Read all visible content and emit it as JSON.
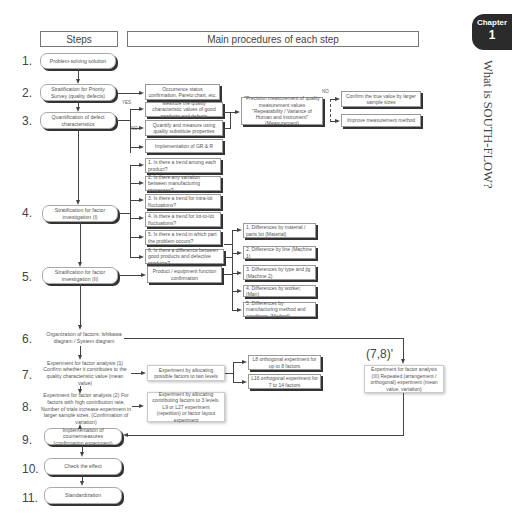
{
  "header": {
    "steps_label": "Steps",
    "main_label": "Main procedures of each step"
  },
  "chapter": {
    "label": "Chapter",
    "number": "1",
    "title": "What is SOUTH-FLOW?"
  },
  "steps": [
    {
      "num": "1.",
      "text": "Problem-solving solution"
    },
    {
      "num": "2.",
      "text": "Stratification for Priority Survey (quality defects)"
    },
    {
      "num": "3.",
      "text": "Quantification of defect characteristics"
    },
    {
      "num": "4.",
      "text": "Stratification for factor investigation (I)"
    },
    {
      "num": "5.",
      "text": "Stratification for factor investigation (II)"
    },
    {
      "num": "6.",
      "text": "Organization of factors: Ishikawa diagram / System diagram"
    },
    {
      "num": "7.",
      "text": "Experiment for factor analysis (1) Confirm whether it contributes to the quality characteristic value (mean value)"
    },
    {
      "num": "8.",
      "text": "Experiment for factor analysis (2) For factors with high contribution rate, Number of trials increase experiment in larger sample sizes. (Confirmation of variation)"
    },
    {
      "num": "9.",
      "text": "Implementation of countermeasures (confirmation experiment)"
    },
    {
      "num": "10.",
      "text": "Check the effect"
    },
    {
      "num": "11.",
      "text": "Standardization"
    }
  ],
  "step2_proc": "Occurrence status confirmation, Pareto chart, etc.",
  "step3": {
    "yes_label": "YES",
    "no_label": "NO",
    "yes_box": "Measure the quality characteristic values of good products and defects",
    "no_box": "Quantify and measure using quality substitute properties",
    "gr_box": "Implementation of GR & R",
    "precision_box": "\"Precision measurement of quality measurement values \"Repeatability / Variance of Human and Instrument\" (Measurement)",
    "no2_label": "NO",
    "confirm_box": "Confirm the true value by larger sample sizes",
    "improve_box": "Improve measurement method"
  },
  "step4_items": [
    "1. Is there a trend among each product?",
    "2. Is there any variation between manufacturing processes?",
    "3. Is there a trend for intra-lot fluctuations?",
    "4. Is there a trend for lot-to-lot fluctuations?",
    "5. Is there a trend in which part the problem occurs?",
    "6. Is there a difference between good products and defective products?"
  ],
  "step5_proc": "Product / equipment function confirmation",
  "step5_items": [
    "1. Differences by material / parts lot (Material)",
    "2. Difference by line (Machine 1)",
    "3. Differences by type and jig (Machine 2)",
    "4. Differences by worker, (Man)",
    "5. Differences by manufacturing method and conditions (Method)"
  ],
  "step7_proc": "Experiment by allocating possible factors to two levels",
  "step7_items": [
    "L8 orthogonal experiment for up to 8 factors",
    "L16 orthogonal experiment for 7 to 14 factors"
  ],
  "step8_proc": "Experiment by allocating contributing factors to 3 levels. L9 or L27 experiment (repetition) or factor layout experiment",
  "step78": {
    "label": "(7,8)'",
    "box": "Experiment for factor analysis (III) Repeated (arrangement / orthogonal) experiment (mean value, variation)"
  }
}
